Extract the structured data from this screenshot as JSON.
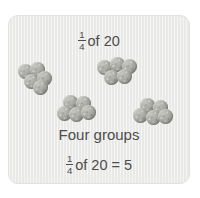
{
  "card": {
    "title": {
      "numerator": "1",
      "denominator": "4",
      "text": "of 20"
    },
    "caption": "Four groups",
    "result": {
      "numerator": "1",
      "denominator": "4",
      "text": "of 20 = 5"
    },
    "background_color": "#e9e9e7",
    "text_color": "#4c4c4c",
    "bead_color": "#a5a5a0"
  },
  "bead_groups": [
    {
      "name": "group-1",
      "count": 5,
      "beads": [
        {
          "x": 0,
          "y": 2
        },
        {
          "x": 12,
          "y": 0
        },
        {
          "x": 6,
          "y": 12
        },
        {
          "x": 19,
          "y": 9
        },
        {
          "x": 15,
          "y": 18
        }
      ]
    },
    {
      "name": "group-2",
      "count": 5,
      "beads": [
        {
          "x": 0,
          "y": 3
        },
        {
          "x": 13,
          "y": 0
        },
        {
          "x": 25,
          "y": 2
        },
        {
          "x": 7,
          "y": 13
        },
        {
          "x": 20,
          "y": 12
        }
      ]
    },
    {
      "name": "group-3",
      "count": 5,
      "beads": [
        {
          "x": 6,
          "y": 0
        },
        {
          "x": 19,
          "y": 1
        },
        {
          "x": 0,
          "y": 11
        },
        {
          "x": 12,
          "y": 12
        },
        {
          "x": 24,
          "y": 10
        }
      ]
    },
    {
      "name": "group-4",
      "count": 5,
      "beads": [
        {
          "x": 7,
          "y": 0
        },
        {
          "x": 20,
          "y": 2
        },
        {
          "x": 0,
          "y": 10
        },
        {
          "x": 13,
          "y": 12
        },
        {
          "x": 25,
          "y": 11
        }
      ]
    }
  ]
}
